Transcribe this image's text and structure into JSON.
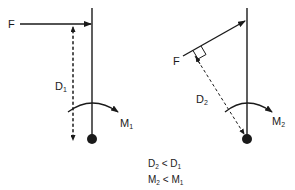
{
  "diagram": {
    "left_panel": {
      "force_label": "F",
      "distance_label": "D",
      "distance_sub": "1",
      "moment_label": "M",
      "moment_sub": "1",
      "force_direction": "horizontal"
    },
    "right_panel": {
      "force_label": "F",
      "distance_label": "D",
      "distance_sub": "2",
      "moment_label": "M",
      "moment_sub": "2",
      "force_direction": "angled"
    },
    "caption": {
      "line1": {
        "a": "D",
        "a_sub": "2",
        "op": " < ",
        "b": "D",
        "b_sub": "1"
      },
      "line2": {
        "a": "M",
        "a_sub": "2",
        "op": " < ",
        "b": "M",
        "b_sub": "1"
      }
    },
    "colors": {
      "stroke": "#1a1a1a",
      "background": "#ffffff"
    }
  }
}
